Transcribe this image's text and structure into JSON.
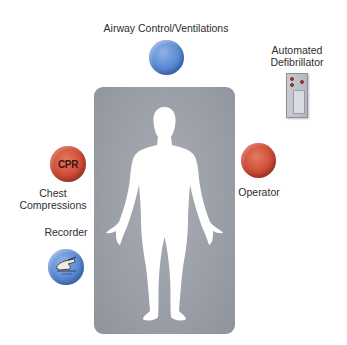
{
  "roles": {
    "airway": {
      "label": "Airway Control/Ventilations",
      "color": "#5f8fd6"
    },
    "defibrillator": {
      "label_line1": "Automated",
      "label_line2": "Defibrillator"
    },
    "chest_compressions": {
      "badge": "CPR",
      "label_line1": "Chest",
      "label_line2": "Compressions",
      "color": "#cf4f3a"
    },
    "operator": {
      "label": "Operator",
      "color": "#cf4f3a"
    },
    "recorder": {
      "label": "Recorder",
      "color": "#5f8fd6",
      "icon": "hand-writing-icon"
    }
  },
  "patient": {
    "icon": "human-silhouette-icon",
    "background": "#9a9ea6"
  }
}
